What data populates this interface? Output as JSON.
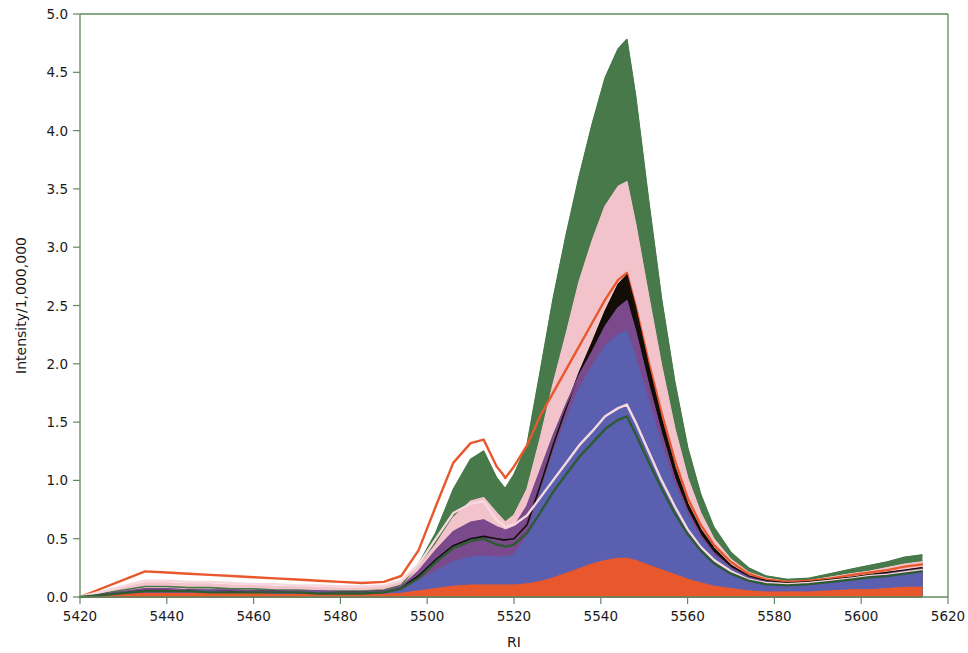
{
  "chart_data": {
    "type": "area",
    "title": "",
    "subtitle": "",
    "xlabel": "RI",
    "ylabel": "Intensity/1,000,000",
    "xlim": [
      5420,
      5620
    ],
    "ylim": [
      0.0,
      5.0
    ],
    "xticks": [
      5420,
      5440,
      5460,
      5480,
      5500,
      5520,
      5540,
      5560,
      5580,
      5600,
      5620
    ],
    "xtick_labels": [
      "5420",
      "5440",
      "5460",
      "5480",
      "5500",
      "5520",
      "5540",
      "5560",
      "5580",
      "5600",
      "5620"
    ],
    "yticks": [
      0.0,
      0.5,
      1.0,
      1.5,
      2.0,
      2.5,
      3.0,
      3.5,
      4.0,
      4.5,
      5.0
    ],
    "ytick_labels": [
      "0.0",
      "0.5",
      "1.0",
      "1.5",
      "2.0",
      "2.5",
      "3.0",
      "3.5",
      "4.0",
      "4.5",
      "5.0"
    ],
    "grid": false,
    "legend": "none",
    "axis_color": "#5f8a5f",
    "x": [
      5420,
      5435,
      5440,
      5445,
      5450,
      5455,
      5460,
      5465,
      5470,
      5475,
      5480,
      5485,
      5490,
      5494,
      5498,
      5502,
      5506,
      5510,
      5513,
      5516,
      5517.5,
      5518,
      5520,
      5523,
      5526,
      5529,
      5532,
      5535,
      5538,
      5541,
      5544,
      5546,
      5548,
      5551,
      5554,
      5557,
      5560,
      5563,
      5566,
      5570,
      5574,
      5578,
      5583,
      5588,
      5593,
      5598,
      5602,
      5606,
      5610,
      5614
    ],
    "series": [
      {
        "name": "trace-green",
        "color": "#47794a",
        "filled": true,
        "values": [
          0.0,
          0.09,
          0.09,
          0.08,
          0.08,
          0.07,
          0.07,
          0.06,
          0.06,
          0.05,
          0.05,
          0.05,
          0.06,
          0.1,
          0.28,
          0.55,
          0.92,
          1.18,
          1.25,
          1.02,
          0.95,
          0.93,
          1.05,
          1.3,
          1.92,
          2.55,
          3.1,
          3.6,
          4.05,
          4.45,
          4.7,
          4.78,
          4.3,
          3.4,
          2.55,
          1.85,
          1.28,
          0.88,
          0.6,
          0.38,
          0.25,
          0.18,
          0.15,
          0.16,
          0.2,
          0.24,
          0.27,
          0.3,
          0.34,
          0.36
        ]
      },
      {
        "name": "trace-pink",
        "color": "#f2c3cb",
        "filled": true,
        "values": [
          0.0,
          0.12,
          0.12,
          0.11,
          0.11,
          0.1,
          0.1,
          0.09,
          0.09,
          0.08,
          0.08,
          0.08,
          0.09,
          0.13,
          0.26,
          0.45,
          0.68,
          0.82,
          0.85,
          0.72,
          0.66,
          0.64,
          0.7,
          0.92,
          1.35,
          1.82,
          2.25,
          2.7,
          3.05,
          3.35,
          3.52,
          3.56,
          3.2,
          2.58,
          1.98,
          1.45,
          1.02,
          0.72,
          0.5,
          0.32,
          0.21,
          0.16,
          0.13,
          0.14,
          0.17,
          0.2,
          0.22,
          0.25,
          0.28,
          0.3
        ]
      },
      {
        "name": "trace-orange",
        "color": "#e8582c",
        "filled": false,
        "values": [
          0.0,
          0.22,
          0.21,
          0.2,
          0.19,
          0.18,
          0.17,
          0.16,
          0.15,
          0.14,
          0.13,
          0.12,
          0.13,
          0.18,
          0.4,
          0.78,
          1.15,
          1.32,
          1.35,
          1.12,
          1.05,
          1.02,
          1.12,
          1.3,
          1.55,
          1.75,
          1.95,
          2.15,
          2.35,
          2.55,
          2.72,
          2.78,
          2.5,
          2.02,
          1.58,
          1.18,
          0.85,
          0.62,
          0.45,
          0.3,
          0.2,
          0.15,
          0.13,
          0.14,
          0.16,
          0.19,
          0.21,
          0.23,
          0.26,
          0.28
        ]
      },
      {
        "name": "trace-black",
        "color": "#120d07",
        "filled": true,
        "values": [
          0.0,
          0.06,
          0.06,
          0.06,
          0.05,
          0.05,
          0.05,
          0.05,
          0.04,
          0.04,
          0.04,
          0.04,
          0.05,
          0.08,
          0.18,
          0.32,
          0.44,
          0.5,
          0.52,
          0.5,
          0.49,
          0.49,
          0.5,
          0.62,
          0.95,
          1.3,
          1.62,
          1.92,
          2.18,
          2.45,
          2.68,
          2.76,
          2.48,
          1.98,
          1.52,
          1.12,
          0.8,
          0.58,
          0.42,
          0.27,
          0.18,
          0.14,
          0.12,
          0.13,
          0.15,
          0.17,
          0.19,
          0.21,
          0.23,
          0.25
        ]
      },
      {
        "name": "trace-purple",
        "color": "#7a4a8c",
        "filled": true,
        "values": [
          0.0,
          0.07,
          0.07,
          0.06,
          0.06,
          0.06,
          0.05,
          0.05,
          0.05,
          0.05,
          0.04,
          0.04,
          0.05,
          0.09,
          0.22,
          0.4,
          0.56,
          0.64,
          0.66,
          0.6,
          0.58,
          0.57,
          0.6,
          0.78,
          1.08,
          1.38,
          1.65,
          1.9,
          2.1,
          2.32,
          2.48,
          2.54,
          2.28,
          1.82,
          1.4,
          1.02,
          0.74,
          0.53,
          0.38,
          0.25,
          0.17,
          0.13,
          0.11,
          0.12,
          0.14,
          0.16,
          0.18,
          0.2,
          0.22,
          0.24
        ]
      },
      {
        "name": "trace-blue",
        "color": "#5a5fb0",
        "filled": true,
        "values": [
          0.0,
          0.05,
          0.05,
          0.05,
          0.05,
          0.04,
          0.04,
          0.04,
          0.04,
          0.04,
          0.03,
          0.03,
          0.04,
          0.07,
          0.14,
          0.22,
          0.3,
          0.34,
          0.35,
          0.34,
          0.34,
          0.34,
          0.36,
          0.52,
          0.88,
          1.22,
          1.52,
          1.78,
          1.98,
          2.15,
          2.25,
          2.28,
          2.05,
          1.68,
          1.3,
          0.96,
          0.7,
          0.5,
          0.36,
          0.24,
          0.16,
          0.12,
          0.1,
          0.11,
          0.13,
          0.15,
          0.17,
          0.19,
          0.21,
          0.22
        ]
      },
      {
        "name": "trace-orange-base",
        "color": "#e8582c",
        "filled": true,
        "values": [
          0.0,
          0.03,
          0.03,
          0.03,
          0.03,
          0.03,
          0.03,
          0.02,
          0.02,
          0.02,
          0.02,
          0.02,
          0.02,
          0.03,
          0.05,
          0.07,
          0.09,
          0.1,
          0.1,
          0.1,
          0.1,
          0.1,
          0.1,
          0.11,
          0.13,
          0.16,
          0.2,
          0.24,
          0.28,
          0.31,
          0.33,
          0.33,
          0.31,
          0.27,
          0.23,
          0.19,
          0.15,
          0.12,
          0.09,
          0.07,
          0.05,
          0.04,
          0.04,
          0.04,
          0.05,
          0.06,
          0.06,
          0.07,
          0.08,
          0.08
        ]
      },
      {
        "name": "trace-pink-light",
        "color": "#f6d9de",
        "filled": false,
        "values": [
          0.0,
          0.14,
          0.14,
          0.13,
          0.13,
          0.12,
          0.11,
          0.11,
          0.1,
          0.1,
          0.09,
          0.09,
          0.1,
          0.14,
          0.28,
          0.5,
          0.72,
          0.8,
          0.82,
          0.66,
          0.62,
          0.6,
          0.62,
          0.7,
          0.85,
          1.0,
          1.15,
          1.3,
          1.42,
          1.55,
          1.62,
          1.65,
          1.5,
          1.25,
          1.0,
          0.78,
          0.58,
          0.43,
          0.32,
          0.22,
          0.15,
          0.12,
          0.11,
          0.12,
          0.14,
          0.16,
          0.18,
          0.19,
          0.21,
          0.23
        ]
      },
      {
        "name": "trace-darkgreen-line",
        "color": "#2e5a34",
        "filled": false,
        "values": [
          0.0,
          0.05,
          0.05,
          0.05,
          0.04,
          0.04,
          0.04,
          0.04,
          0.04,
          0.03,
          0.03,
          0.03,
          0.04,
          0.07,
          0.16,
          0.3,
          0.42,
          0.48,
          0.5,
          0.45,
          0.44,
          0.43,
          0.45,
          0.55,
          0.72,
          0.9,
          1.05,
          1.2,
          1.32,
          1.44,
          1.52,
          1.55,
          1.4,
          1.16,
          0.93,
          0.72,
          0.54,
          0.4,
          0.29,
          0.2,
          0.14,
          0.11,
          0.1,
          0.11,
          0.13,
          0.15,
          0.17,
          0.18,
          0.2,
          0.22
        ]
      }
    ],
    "annotations": [
      {
        "label": "main-peak-apex",
        "x": 5546,
        "y": 4.78
      },
      {
        "label": "secondary-peak",
        "x": 5513,
        "y": 1.35
      },
      {
        "label": "step-drop",
        "x": 5518,
        "y": 0.93
      }
    ]
  }
}
